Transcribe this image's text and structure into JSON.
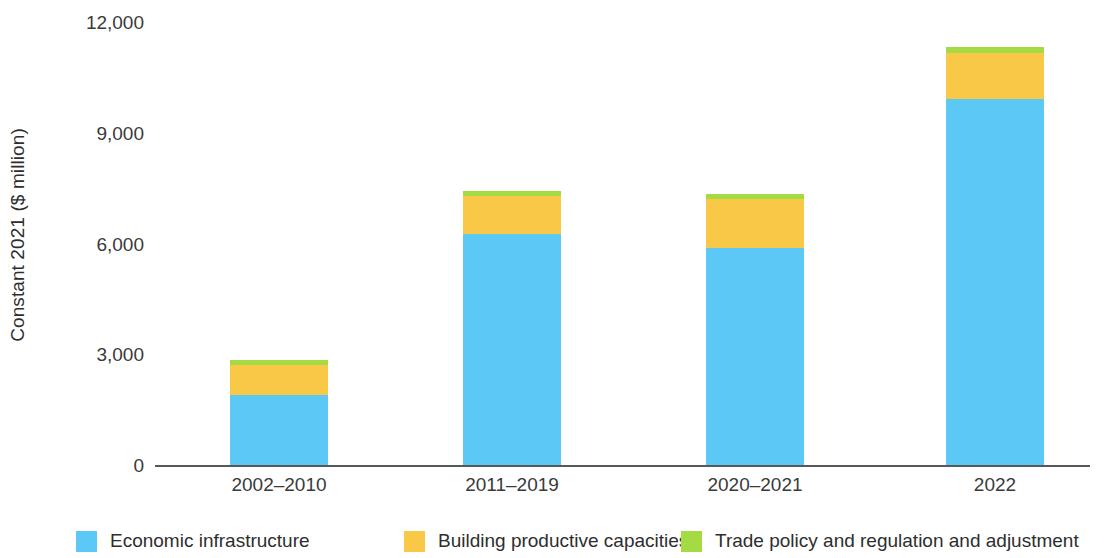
{
  "chart_data": {
    "type": "bar",
    "subtype": "stacked-bar",
    "title": "",
    "xlabel": "",
    "ylabel": "Constant 2021 ($ million)",
    "categories": [
      "2002–2010",
      "2011–2019",
      "2020–2021",
      "2022"
    ],
    "series": [
      {
        "name": "Economic infrastructure",
        "color": "#5BC8F5",
        "values": [
          1900,
          6260,
          5880,
          9920
        ]
      },
      {
        "name": "Building productive capacities",
        "color": "#F9C846",
        "values": [
          800,
          1030,
          1330,
          1250
        ]
      },
      {
        "name": "Trade policy and regulation and adjustment",
        "color": "#A4DB45",
        "values": [
          140,
          135,
          135,
          160
        ]
      }
    ],
    "totals": [
      2840,
      7425,
      7345,
      11330
    ],
    "ylim": [
      0,
      12000
    ],
    "yticks": [
      0,
      3000,
      6000,
      9000,
      12000
    ],
    "ytick_labels": [
      "0",
      "3,000",
      "6,000",
      "9,000",
      "12,000"
    ],
    "grid": false,
    "legend_position": "bottom",
    "axis_color": "#55595c"
  },
  "axes": {
    "y_title": "Constant 2021 ($ million)",
    "y_ticks": [
      {
        "value": 12000,
        "label": "12,000"
      },
      {
        "value": 9000,
        "label": "9,000"
      },
      {
        "value": 6000,
        "label": "6,000"
      },
      {
        "value": 3000,
        "label": "3,000"
      },
      {
        "value": 0,
        "label": "0"
      }
    ],
    "x_ticks": [
      {
        "label": "2002–2010"
      },
      {
        "label": "2011–2019"
      },
      {
        "label": "2020–2021"
      },
      {
        "label": "2022"
      }
    ]
  },
  "legend": {
    "items": [
      {
        "label": "Economic infrastructure",
        "color": "#5BC8F5"
      },
      {
        "label": "Building productive capacities",
        "color": "#F9C846"
      },
      {
        "label": "Trade policy and regulation and adjustment",
        "color": "#A4DB45"
      }
    ]
  }
}
